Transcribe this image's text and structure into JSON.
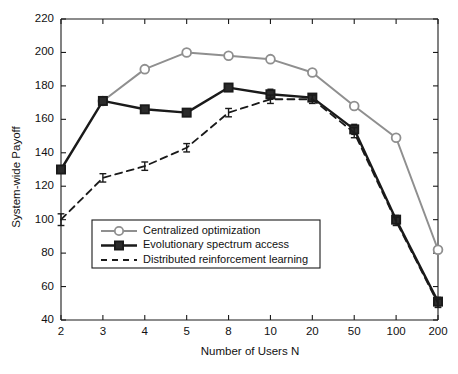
{
  "chart_data": {
    "type": "line",
    "title": "",
    "xlabel": "Number of Users N",
    "ylabel": "System-wide Payoff",
    "categories": [
      "2",
      "3",
      "4",
      "5",
      "8",
      "10",
      "20",
      "50",
      "100",
      "200"
    ],
    "xtick_labels": [
      "2",
      "3",
      "4",
      "5",
      "8",
      "10",
      "20",
      "50",
      "100",
      "200"
    ],
    "ytick_labels": [
      "40",
      "60",
      "80",
      "100",
      "120",
      "140",
      "160",
      "180",
      "200",
      "220"
    ],
    "yticks": [
      40,
      60,
      80,
      100,
      120,
      140,
      160,
      180,
      200,
      220
    ],
    "ylim": [
      40,
      220
    ],
    "xscale": "categorical-log",
    "grid": false,
    "legend_position": "lower-left-inside",
    "series": [
      {
        "name": "Centralized optimization",
        "key": "centralized",
        "marker": "circle-open",
        "linestyle": "solid",
        "color": "#8f8f8f",
        "linewidth": 2.0,
        "values": [
          null,
          171,
          190,
          200,
          198,
          196,
          188,
          168,
          149,
          82
        ],
        "errors": [
          null,
          null,
          null,
          null,
          null,
          null,
          null,
          null,
          null,
          null
        ]
      },
      {
        "name": "Evolutionary spectrum access",
        "key": "evolutionary",
        "marker": "square-filled",
        "linestyle": "solid",
        "color": "#1a1a1a",
        "linewidth": 2.4,
        "values": [
          130,
          171,
          166,
          164,
          179,
          175,
          173,
          154,
          100,
          51
        ],
        "errors": [
          1.5,
          1.5,
          1.5,
          1.5,
          1.5,
          3.0,
          1.5,
          3.0,
          2.5,
          2.5
        ]
      },
      {
        "name": "Distributed reinforcement learning",
        "key": "distributed",
        "marker": "errorbar",
        "linestyle": "dashed",
        "color": "#1a1a1a",
        "linewidth": 1.8,
        "values": [
          100,
          125,
          132,
          143,
          164,
          172,
          172,
          152,
          99,
          50
        ],
        "errors": [
          3.5,
          2.5,
          2.5,
          2.5,
          2.5,
          2.5,
          2.5,
          3.0,
          2.5,
          2.5
        ]
      }
    ]
  },
  "legend": {
    "entries": [
      {
        "label": "Centralized optimization"
      },
      {
        "label": "Evolutionary spectrum access"
      },
      {
        "label": "Distributed reinforcement learning"
      }
    ]
  },
  "colors": {
    "gray_series": "#8f8f8f",
    "black_series": "#1a1a1a",
    "axis": "#1a1a1a",
    "background": "#ffffff"
  }
}
